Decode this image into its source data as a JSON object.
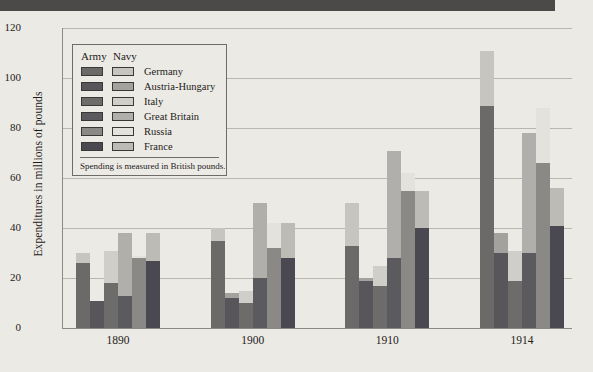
{
  "figure": {
    "ylabel": "Expenditures in millions of pounds",
    "legend_header_army": "Army",
    "legend_header_navy": "Navy",
    "legend_note": "Spending is measured in British pounds."
  },
  "colors": {
    "background": "#eceae5",
    "header_band": "#4c4a48",
    "gridline": "#b9b6b0",
    "axis": "#8d8a84",
    "text": "#1d1b19",
    "army": [
      "#6b6a68",
      "#58565a",
      "#6e6c6a",
      "#5b5a5e",
      "#8a8986",
      "#4a4850"
    ],
    "navy": [
      "#c6c5c0",
      "#a3a29e",
      "#cfcec9",
      "#b0afab",
      "#e3e2dd",
      "#bcbbb6"
    ]
  },
  "chart_data": {
    "type": "bar",
    "title": "",
    "xlabel": "",
    "ylabel": "Expenditures in millions of pounds",
    "ylim": [
      0,
      120
    ],
    "yticks": [
      0,
      20,
      40,
      60,
      80,
      100,
      120
    ],
    "grid": true,
    "stacked": true,
    "legend_position": "inside-upper-left",
    "categories": [
      "1890",
      "1900",
      "1910",
      "1914"
    ],
    "countries": [
      "Germany",
      "Austria-Hungary",
      "Italy",
      "Great Britain",
      "Russia",
      "France"
    ],
    "series": [
      {
        "name": "Army",
        "by_country": {
          "Germany": [
            26,
            35,
            33,
            89
          ],
          "Austria-Hungary": [
            11,
            12,
            19,
            30
          ],
          "Italy": [
            18,
            10,
            17,
            19
          ],
          "Great Britain": [
            13,
            20,
            28,
            30
          ],
          "Russia": [
            28,
            32,
            55,
            66
          ],
          "France": [
            27,
            28,
            40,
            41
          ]
        }
      },
      {
        "name": "Navy",
        "by_country": {
          "Germany": [
            4,
            5,
            17,
            22
          ],
          "Austria-Hungary": [
            0,
            2,
            1,
            8
          ],
          "Italy": [
            13,
            5,
            8,
            12
          ],
          "Great Britain": [
            25,
            30,
            43,
            48
          ],
          "Russia": [
            1,
            10,
            7,
            22
          ],
          "France": [
            11,
            14,
            15,
            15
          ]
        }
      }
    ],
    "totals": {
      "Germany": [
        30,
        40,
        50,
        111
      ],
      "Austria-Hungary": [
        11,
        14,
        20,
        38
      ],
      "Italy": [
        31,
        15,
        25,
        31
      ],
      "Great Britain": [
        38,
        50,
        71,
        78
      ],
      "Russia": [
        29,
        42,
        62,
        88
      ],
      "France": [
        38,
        42,
        55,
        56
      ]
    }
  }
}
